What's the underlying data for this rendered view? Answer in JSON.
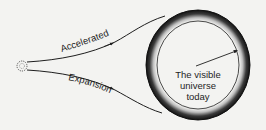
{
  "diagram": {
    "labels": {
      "upper_curve": "Accelerated",
      "lower_curve": "Expansion",
      "circle_line1": "The visible",
      "circle_line2": "universe",
      "circle_line3": "today"
    },
    "elements": {
      "origin": "small dotted circle (early universe)",
      "outer_ring": "shaded ring (visible universe boundary)",
      "inner_arrow": "radius arrow"
    },
    "colors": {
      "background": "#f3f3f1",
      "ink": "#1e1e1e"
    }
  }
}
